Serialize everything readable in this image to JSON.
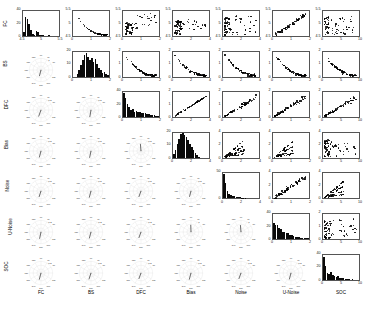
{
  "figure": {
    "kind": "scatter-plot-matrix",
    "variables": [
      "FC",
      "BS",
      "DFC",
      "Bias",
      "Noise",
      "U-Noise",
      "SOC"
    ],
    "structure": {
      "diagonal": "histogram",
      "upper_triangle": "scatter",
      "lower_triangle": "polar-compass-correlation"
    }
  },
  "labels": {
    "columns": [
      "FC",
      "BS",
      "DFC",
      "Bias",
      "Noise",
      "U-Noise",
      "SOC"
    ],
    "rows": [
      "FC",
      "BS",
      "DFC",
      "Bias",
      "Noise",
      "U-Noise",
      "SOC"
    ]
  },
  "chart_data": {
    "type": "scatter",
    "title": "",
    "xlabel": "",
    "ylabel": "",
    "grid": false,
    "legend": "none",
    "variables": [
      "FC",
      "BS",
      "DFC",
      "Bias",
      "Noise",
      "U-Noise",
      "SOC"
    ],
    "axis_ranges": {
      "FC": [
        4.5,
        5.5
      ],
      "BS": [
        0,
        2
      ],
      "DFC": [
        0,
        2
      ],
      "Bias": [
        0,
        4
      ],
      "Noise": [
        0,
        4
      ],
      "U-Noise": [
        0,
        2
      ],
      "SOC": [
        0,
        10
      ]
    },
    "axis_ticks": {
      "FC": [
        "4.5",
        "5",
        "5.5"
      ],
      "BS": [
        "0",
        "1",
        "2"
      ],
      "DFC": [
        "0",
        "1",
        "2"
      ],
      "Bias": [
        "0",
        "2",
        "4"
      ],
      "Noise": [
        "0",
        "2",
        "4"
      ],
      "U-Noise": [
        "0",
        "1",
        "2"
      ],
      "SOC": [
        "0",
        "5",
        "10"
      ]
    },
    "histograms": [
      {
        "var": "FC",
        "ylim": [
          0,
          40
        ],
        "yticks": [
          "0",
          "20",
          "40"
        ],
        "xlim": [
          4.5,
          5.5
        ],
        "xticks": [
          "4.5",
          "5",
          "5.5"
        ],
        "counts": [
          6,
          31,
          27,
          19,
          9,
          3,
          2,
          8,
          7,
          2,
          1,
          1,
          0,
          0,
          1,
          0,
          0,
          0,
          0,
          0
        ]
      },
      {
        "var": "BS",
        "ylim": [
          0,
          20
        ],
        "yticks": [
          "0",
          "10",
          "20"
        ],
        "xlim": [
          0,
          2
        ],
        "xticks": [
          "0",
          "1",
          "2"
        ],
        "counts": [
          0,
          0,
          2,
          5,
          9,
          13,
          17,
          19,
          16,
          13,
          15,
          12,
          14,
          10,
          7,
          5,
          3,
          4,
          2,
          1
        ]
      },
      {
        "var": "DFC",
        "ylim": [
          0,
          40
        ],
        "yticks": [
          "0",
          "20",
          "40"
        ],
        "xlim": [
          0,
          2
        ],
        "xticks": [
          "0",
          "1",
          "2"
        ],
        "counts": [
          38,
          30,
          21,
          16,
          12,
          13,
          9,
          10,
          8,
          9,
          7,
          7,
          6,
          5,
          5,
          4,
          3,
          3,
          2,
          2
        ]
      },
      {
        "var": "Bias",
        "ylim": [
          0,
          20
        ],
        "yticks": [
          "0",
          "10",
          "20"
        ],
        "xlim": [
          0,
          4
        ],
        "xticks": [
          "0",
          "2",
          "4"
        ],
        "counts": [
          3,
          6,
          11,
          15,
          19,
          20,
          18,
          17,
          14,
          11,
          9,
          6,
          4,
          2,
          1,
          0,
          0,
          0,
          0,
          0
        ]
      },
      {
        "var": "Noise",
        "ylim": [
          0,
          50
        ],
        "yticks": [
          "0",
          "50"
        ],
        "xlim": [
          0,
          4
        ],
        "xticks": [
          "0",
          "2",
          "4"
        ],
        "counts": [
          49,
          30,
          14,
          9,
          6,
          5,
          4,
          3,
          2,
          2,
          1,
          1,
          1,
          0,
          0,
          0,
          0,
          0,
          0,
          0
        ]
      },
      {
        "var": "U-Noise",
        "ylim": [
          0,
          40
        ],
        "yticks": [
          "0",
          "20",
          "40"
        ],
        "xlim": [
          0,
          2
        ],
        "xticks": [
          "0",
          "1",
          "2"
        ],
        "counts": [
          26,
          22,
          23,
          18,
          16,
          12,
          12,
          9,
          10,
          7,
          6,
          5,
          4,
          4,
          3,
          2,
          2,
          1,
          1,
          1
        ]
      },
      {
        "var": "SOC",
        "ylim": [
          0,
          40
        ],
        "yticks": [
          "0",
          "20",
          "40"
        ],
        "xlim": [
          0,
          10
        ],
        "xticks": [
          "0",
          "5",
          "10"
        ],
        "counts": [
          36,
          22,
          11,
          9,
          12,
          8,
          6,
          4,
          5,
          3,
          2,
          2,
          1,
          1,
          1,
          0,
          1,
          0,
          0,
          0
        ]
      }
    ],
    "polar_plots": {
      "angle_ticks": [
        "30",
        "60",
        "90",
        "120",
        "150",
        "180",
        "210",
        "240",
        "270",
        "300",
        "330"
      ],
      "radial_tick_labels": [
        "0.2",
        "0.5",
        "1"
      ],
      "cells": [
        {
          "row": "BS",
          "col": "FC",
          "r_label": "1",
          "angle_deg": 255,
          "r": 0.55
        },
        {
          "row": "DFC",
          "col": "FC",
          "r_label": "0.5",
          "angle_deg": 250,
          "r": 0.6
        },
        {
          "row": "DFC",
          "col": "BS",
          "r_label": "0.5",
          "angle_deg": 260,
          "r": 0.62
        },
        {
          "row": "Bias",
          "col": "FC",
          "r_label": "0.5",
          "angle_deg": 255,
          "r": 0.58
        },
        {
          "row": "Bias",
          "col": "BS",
          "r_label": "0.5",
          "angle_deg": 258,
          "r": 0.6
        },
        {
          "row": "Bias",
          "col": "DFC",
          "r_label": "0.5",
          "angle_deg": 95,
          "r": 0.62
        },
        {
          "row": "Noise",
          "col": "FC",
          "r_label": "0.5",
          "angle_deg": 252,
          "r": 0.55
        },
        {
          "row": "Noise",
          "col": "BS",
          "r_label": "0.5",
          "angle_deg": 255,
          "r": 0.6
        },
        {
          "row": "Noise",
          "col": "DFC",
          "r_label": "0.5",
          "angle_deg": 250,
          "r": 0.55
        },
        {
          "row": "Noise",
          "col": "Bias",
          "r_label": "0.5",
          "angle_deg": 255,
          "r": 0.52
        },
        {
          "row": "U-Noise",
          "col": "FC",
          "r_label": "0.2",
          "angle_deg": 258,
          "r": 0.6
        },
        {
          "row": "U-Noise",
          "col": "BS",
          "r_label": "0.2",
          "angle_deg": 255,
          "r": 0.58
        },
        {
          "row": "U-Noise",
          "col": "DFC",
          "r_label": "0.2",
          "angle_deg": 250,
          "r": 0.55
        },
        {
          "row": "U-Noise",
          "col": "Bias",
          "r_label": "1",
          "angle_deg": 92,
          "r": 0.62
        },
        {
          "row": "U-Noise",
          "col": "Noise",
          "r_label": "1",
          "angle_deg": 95,
          "r": 0.6
        },
        {
          "row": "SOC",
          "col": "FC",
          "r_label": "0.5",
          "angle_deg": 255,
          "r": 0.6
        },
        {
          "row": "SOC",
          "col": "BS",
          "r_label": "0.5",
          "angle_deg": 252,
          "r": 0.58
        },
        {
          "row": "SOC",
          "col": "DFC",
          "r_label": "0.5",
          "angle_deg": 250,
          "r": 0.55
        },
        {
          "row": "SOC",
          "col": "Bias",
          "r_label": "0.5",
          "angle_deg": 255,
          "r": 0.6
        },
        {
          "row": "SOC",
          "col": "Noise",
          "r_label": "0.2",
          "angle_deg": 250,
          "r": 0.55
        },
        {
          "row": "SOC",
          "col": "U-Noise",
          "r_label": "0.5",
          "angle_deg": 255,
          "r": 0.58
        }
      ]
    },
    "scatter_panels": [
      {
        "row": "FC",
        "col": "BS",
        "xvar": "BS",
        "yvar": "FC",
        "pattern": "hook",
        "n": 70,
        "corr": -0.8
      },
      {
        "row": "FC",
        "col": "DFC",
        "xvar": "DFC",
        "yvar": "FC",
        "pattern": "cloud-up",
        "n": 70,
        "corr": 0.25
      },
      {
        "row": "FC",
        "col": "Bias",
        "xvar": "Bias",
        "yvar": "FC",
        "pattern": "wedge",
        "n": 70,
        "corr": 0.3
      },
      {
        "row": "FC",
        "col": "Noise",
        "xvar": "Noise",
        "yvar": "FC",
        "pattern": "lowcluster",
        "n": 70,
        "corr": 0.1
      },
      {
        "row": "FC",
        "col": "U-Noise",
        "xvar": "U-Noise",
        "yvar": "FC",
        "pattern": "diag-up",
        "n": 70,
        "corr": 0.75
      },
      {
        "row": "FC",
        "col": "SOC",
        "xvar": "SOC",
        "yvar": "FC",
        "pattern": "scatterwide",
        "n": 70,
        "corr": -0.15
      },
      {
        "row": "BS",
        "col": "DFC",
        "xvar": "DFC",
        "yvar": "BS",
        "pattern": "decay",
        "n": 70,
        "corr": -0.65
      },
      {
        "row": "BS",
        "col": "Bias",
        "xvar": "Bias",
        "yvar": "BS",
        "pattern": "decay",
        "n": 70,
        "corr": -0.6
      },
      {
        "row": "BS",
        "col": "Noise",
        "xvar": "Noise",
        "yvar": "BS",
        "pattern": "decay",
        "n": 70,
        "corr": -0.55
      },
      {
        "row": "BS",
        "col": "U-Noise",
        "xvar": "U-Noise",
        "yvar": "BS",
        "pattern": "decay",
        "n": 70,
        "corr": -0.7
      },
      {
        "row": "BS",
        "col": "SOC",
        "xvar": "SOC",
        "yvar": "BS",
        "pattern": "decay",
        "n": 70,
        "corr": -0.5
      },
      {
        "row": "DFC",
        "col": "Bias",
        "xvar": "Bias",
        "yvar": "DFC",
        "pattern": "linear-up",
        "n": 70,
        "corr": 0.92
      },
      {
        "row": "DFC",
        "col": "Noise",
        "xvar": "Noise",
        "yvar": "DFC",
        "pattern": "fan-up",
        "n": 70,
        "corr": 0.7
      },
      {
        "row": "DFC",
        "col": "U-Noise",
        "xvar": "U-Noise",
        "yvar": "DFC",
        "pattern": "fan-up",
        "n": 70,
        "corr": 0.72
      },
      {
        "row": "DFC",
        "col": "SOC",
        "xvar": "SOC",
        "yvar": "DFC",
        "pattern": "fan-up",
        "n": 70,
        "corr": 0.55
      },
      {
        "row": "Bias",
        "col": "Noise",
        "xvar": "Noise",
        "yvar": "Bias",
        "pattern": "rays",
        "n": 70,
        "corr": 0.6
      },
      {
        "row": "Bias",
        "col": "U-Noise",
        "xvar": "U-Noise",
        "yvar": "Bias",
        "pattern": "rays",
        "n": 70,
        "corr": 0.62
      },
      {
        "row": "Bias",
        "col": "SOC",
        "xvar": "SOC",
        "yvar": "Bias",
        "pattern": "lowcluster",
        "n": 70,
        "corr": 0.2
      },
      {
        "row": "Noise",
        "col": "U-Noise",
        "xvar": "U-Noise",
        "yvar": "Noise",
        "pattern": "diag-up",
        "n": 70,
        "corr": 0.85
      },
      {
        "row": "Noise",
        "col": "SOC",
        "xvar": "SOC",
        "yvar": "Noise",
        "pattern": "rays",
        "n": 70,
        "corr": 0.3
      },
      {
        "row": "U-Noise",
        "col": "SOC",
        "xvar": "SOC",
        "yvar": "U-Noise",
        "pattern": "lowcluster",
        "n": 70,
        "corr": 0.15
      }
    ]
  }
}
